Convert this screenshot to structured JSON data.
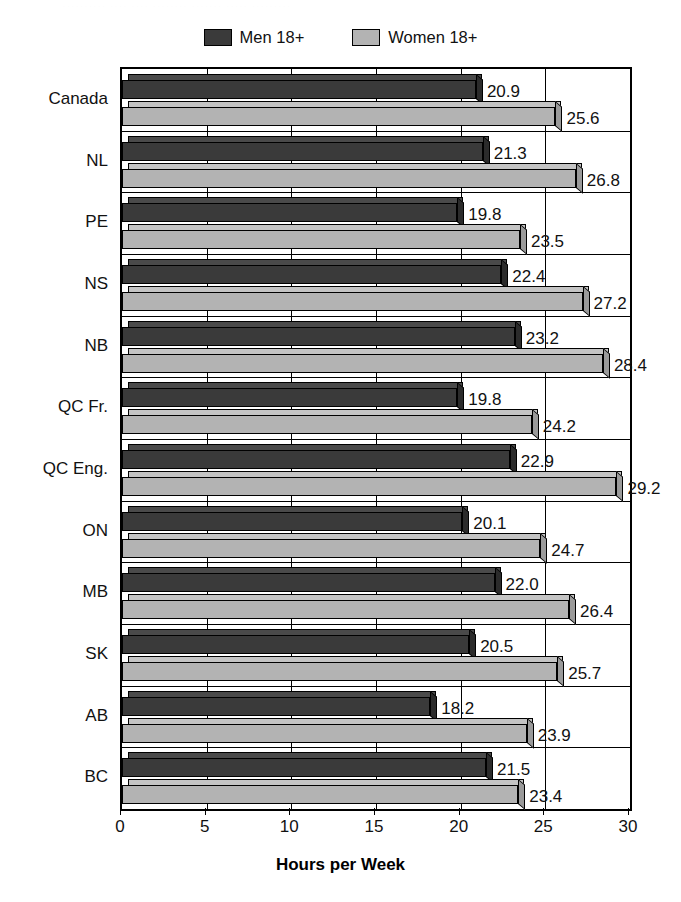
{
  "top_sliver_text": "·········· ···· ···· ········ ······· ····· ·········",
  "legend": {
    "items": [
      {
        "label": "Men 18+",
        "swatch": "men-swatch",
        "color": "#3a3a3a"
      },
      {
        "label": "Women 18+",
        "swatch": "women-swatch",
        "color": "#b3b3b3"
      }
    ]
  },
  "chart_data": {
    "type": "bar",
    "title": "",
    "subtitle": "",
    "orientation": "horizontal",
    "xlabel": "Hours per Week",
    "ylabel": "",
    "xlim": [
      0,
      30
    ],
    "xticks": [
      0,
      5,
      10,
      15,
      20,
      25,
      30
    ],
    "xtick_labels": [
      "0",
      "5",
      "10",
      "15",
      "20",
      "25",
      "30"
    ],
    "grid": true,
    "legend_position": "top-center",
    "categories": [
      "Canada",
      "NL",
      "PE",
      "NS",
      "NB",
      "QC Fr.",
      "QC Eng.",
      "ON",
      "MB",
      "SK",
      "AB",
      "BC"
    ],
    "series": [
      {
        "name": "Men 18+",
        "color": "#3a3a3a",
        "values": [
          20.9,
          21.3,
          19.8,
          22.4,
          23.2,
          19.8,
          22.9,
          20.1,
          22.0,
          20.5,
          18.2,
          21.5
        ],
        "labels": [
          "20.9",
          "21.3",
          "19.8",
          "22.4",
          "23.2",
          "19.8",
          "22.9",
          "20.1",
          "22.0",
          "20.5",
          "18.2",
          "21.5"
        ]
      },
      {
        "name": "Women 18+",
        "color": "#b3b3b3",
        "values": [
          25.6,
          26.8,
          23.5,
          27.2,
          28.4,
          24.2,
          29.2,
          24.7,
          26.4,
          25.7,
          23.9,
          23.4
        ],
        "labels": [
          "25.6",
          "26.8",
          "23.5",
          "27.2",
          "28.4",
          "24.2",
          "29.2",
          "24.7",
          "26.4",
          "25.7",
          "23.9",
          "23.4"
        ]
      }
    ]
  }
}
